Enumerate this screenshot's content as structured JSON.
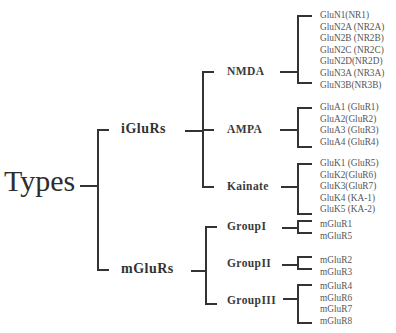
{
  "root": {
    "label": "Types"
  },
  "level1": [
    {
      "label": "iGluRs"
    },
    {
      "label": "mGluRs"
    }
  ],
  "level2": [
    {
      "label": "NMDA"
    },
    {
      "label": "AMPA"
    },
    {
      "label": "Kainate"
    },
    {
      "label": "GroupI"
    },
    {
      "label": "GroupII"
    },
    {
      "label": "GroupIII"
    }
  ],
  "leaves": {
    "nmda": [
      "GluN1(NR1)",
      "GluN2A (NR2A)",
      "GluN2B (NR2B)",
      "GluN2C (NR2C)",
      "GluN2D(NR2D)",
      "GluN3A (NR3A)",
      "GluN3B(NR3B)"
    ],
    "ampa": [
      "GluA1 (GluR1)",
      "GluA2(GluR2)",
      "GluA3 (GluR3)",
      "GluA4 (GluR4)"
    ],
    "kainate": [
      "GluK1 (GluR5)",
      "GluK2(GluR6)",
      "GluK3(GluR7)",
      "GluK4 (KA-1)",
      "GluK5 (KA-2)"
    ],
    "group1": [
      "mGluR1",
      "mGluR5"
    ],
    "group2": [
      "mGluR2",
      "mGluR3"
    ],
    "group3": [
      "mGluR4",
      "mGluR6",
      "mGluR7",
      "mGluR8"
    ]
  }
}
